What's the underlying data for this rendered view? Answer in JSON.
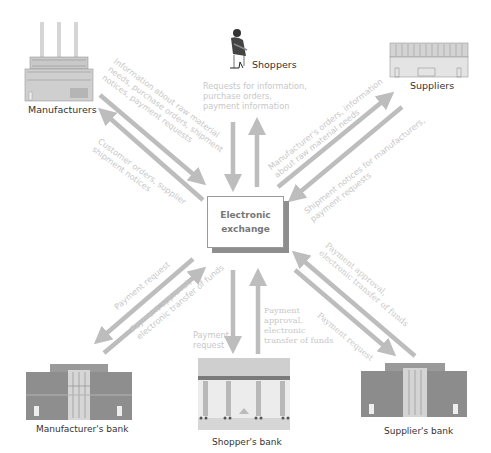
{
  "hub": {
    "line1": "Electronic",
    "line2": "exchange"
  },
  "nodes": {
    "manufacturers": "Manufacturers",
    "shoppers": "Shoppers",
    "suppliers": "Suppliers",
    "manufacturers_bank": "Manufacturer's bank",
    "shoppers_bank": "Shopper's bank",
    "suppliers_bank": "Supplier's bank"
  },
  "flows": {
    "to_manufacturers": [
      "Information about raw material",
      "needs, purchase orders, shipment",
      "notices, payment requests"
    ],
    "from_manufacturers": [
      "Customer orders, supplier",
      "shipment notices"
    ],
    "shoppers": [
      "Requests for information,",
      "purchase orders,",
      "payment information"
    ],
    "to_suppliers": [
      "Manufacturer's orders, information",
      "about raw material needs"
    ],
    "from_suppliers": [
      "Shipment notices for manufacturers,",
      "payment requests"
    ],
    "manufacturers_bank_request": [
      "Payment request"
    ],
    "manufacturers_bank_approval": [
      "Payment approval,",
      "electronic transfer of funds"
    ],
    "shoppers_bank_request": [
      "Payment",
      "request"
    ],
    "shoppers_bank_approval": [
      "Payment",
      "approval,",
      "electronic",
      "transfer of funds"
    ],
    "suppliers_bank_approval": [
      "Payment approval,",
      "electronic transfer of funds"
    ],
    "suppliers_bank_request": [
      "Payment request"
    ]
  },
  "colors": {
    "arrow": "#bdbdbd",
    "flow_text": "#c8c8c8",
    "label_text": "#333333",
    "hub_border": "#9a9a9a",
    "hub_shadow": "#8e8e8e"
  }
}
